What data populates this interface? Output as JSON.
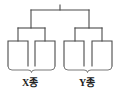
{
  "diagram": {
    "type": "binary-tree-cladogram",
    "title": "",
    "line_color": "#4a4a4a",
    "brace_color": "#6a6a6a",
    "background_color": "#ffffff",
    "root": {
      "name": "root-node",
      "stem_top_y": 5,
      "bar_y": 10,
      "bar_x1": 31,
      "bar_x2": 89
    },
    "groups": [
      {
        "id": "group-x",
        "label": "X종",
        "bar_y": 28,
        "bar_x1": 18,
        "bar_x2": 45,
        "brace_y": 68,
        "brace_x1": 8,
        "brace_x2": 55,
        "leaves": [
          {
            "id": "leaf-x1",
            "cx": 18,
            "box_left": 8,
            "box_right": 28,
            "box_top": 41,
            "box_bottom": 66
          },
          {
            "id": "leaf-x2",
            "cx": 45,
            "box_left": 35,
            "box_right": 55,
            "box_top": 41,
            "box_bottom": 66
          }
        ]
      },
      {
        "id": "group-y",
        "label": "Y종",
        "bar_y": 28,
        "bar_x1": 75,
        "bar_x2": 102,
        "brace_y": 68,
        "brace_x1": 64,
        "brace_x2": 112,
        "leaves": [
          {
            "id": "leaf-y1",
            "cx": 75,
            "box_left": 64,
            "box_right": 84,
            "box_top": 41,
            "box_bottom": 66
          },
          {
            "id": "leaf-y2",
            "cx": 102,
            "box_left": 92,
            "box_right": 112,
            "box_top": 41,
            "box_bottom": 66
          }
        ]
      }
    ]
  },
  "labels": {
    "x_group": "X종",
    "y_group": "Y종"
  }
}
